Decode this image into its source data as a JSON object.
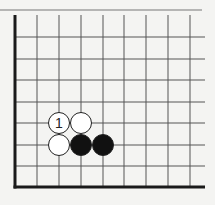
{
  "diagram": {
    "type": "go-board-corner",
    "corner": "bottom-left",
    "colors": {
      "background": "#f4f4f2",
      "line": "#555555",
      "edge": "#1a1a1a",
      "black_stone": "#111111",
      "white_stone": "#ffffff"
    },
    "grid": {
      "columns_x": [
        15,
        37,
        59,
        81,
        103,
        124,
        146,
        168,
        190
      ],
      "rows_y": [
        37,
        59,
        80,
        102,
        123,
        145,
        166,
        187
      ],
      "top_y": 15,
      "right_extent_x": 205
    },
    "stones": [
      {
        "color": "white",
        "col": 2,
        "row": 4,
        "label": "1"
      },
      {
        "color": "white",
        "col": 3,
        "row": 4,
        "label": ""
      },
      {
        "color": "white",
        "col": 2,
        "row": 5,
        "label": ""
      },
      {
        "color": "black",
        "col": 3,
        "row": 5,
        "label": ""
      },
      {
        "color": "black",
        "col": 4,
        "row": 5,
        "label": ""
      }
    ]
  }
}
